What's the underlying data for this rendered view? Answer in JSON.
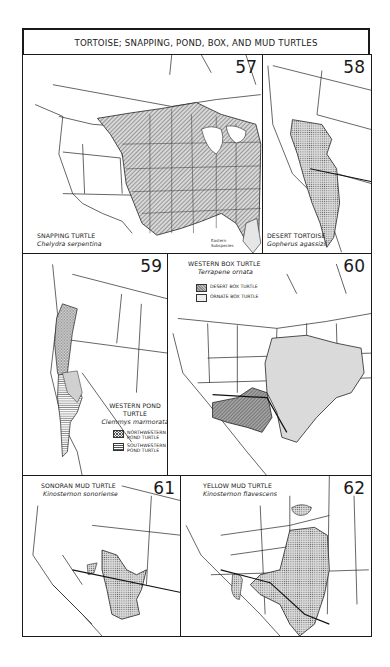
{
  "page": {
    "title": "TORTOISE; SNAPPING, POND, BOX, AND MUD TURTLES"
  },
  "colors": {
    "ink": "#1a1a1a",
    "paper": "#ffffff",
    "range_fill": "#bdbdbd",
    "range_dark": "#8a8a8a"
  },
  "maps": [
    {
      "number": "57",
      "common_name": "SNAPPING TURTLE",
      "scientific_name": "Chelydra serpentina",
      "annotation": "Eastern Subspecies",
      "pattern": "diagonal-hatch"
    },
    {
      "number": "58",
      "common_name": "DESERT TORTOISE",
      "scientific_name": "Gopherus agassizii",
      "pattern": "stipple"
    },
    {
      "number": "59",
      "common_name": "WESTERN POND TURTLE",
      "scientific_name": "Clemmys marmorata",
      "legend": [
        {
          "label": "NORTHWESTERN POND TURTLE",
          "pattern": "crosshatch"
        },
        {
          "label": "SOUTHWESTERN POND TURTLE",
          "pattern": "horizontal-lines"
        }
      ]
    },
    {
      "number": "60",
      "common_name": "WESTERN BOX TURTLE",
      "scientific_name": "Terrapene ornata",
      "legend": [
        {
          "label": "DESERT BOX TURTLE",
          "pattern": "dark-hatch"
        },
        {
          "label": "ORNATE BOX TURTLE",
          "pattern": "light-dots"
        }
      ]
    },
    {
      "number": "61",
      "common_name": "SONORAN MUD TURTLE",
      "scientific_name": "Kinosternon sonoriense",
      "pattern": "stipple"
    },
    {
      "number": "62",
      "common_name": "YELLOW MUD TURTLE",
      "scientific_name": "Kinosternon flavescens",
      "pattern": "stipple"
    }
  ]
}
